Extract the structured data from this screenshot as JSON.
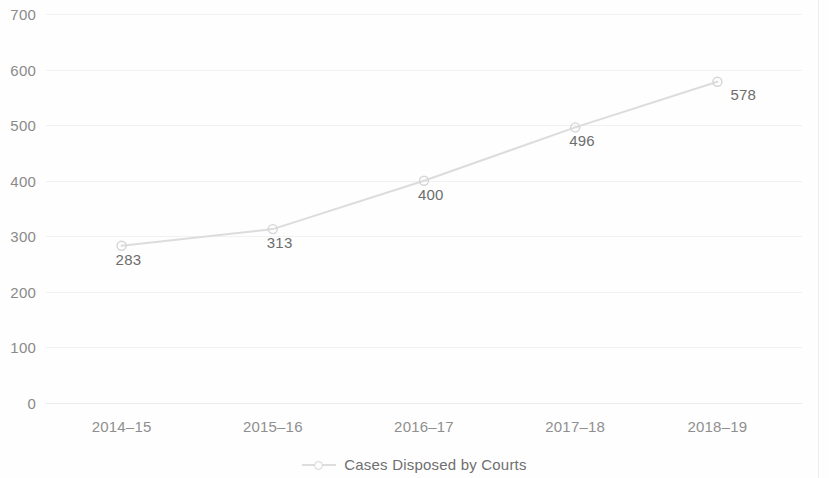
{
  "chart_data": {
    "type": "line",
    "title": "",
    "subtitle": "",
    "xlabel": "",
    "ylabel": "",
    "categories": [
      "2014–15",
      "2015–16",
      "2016–17",
      "2017–18",
      "2018–19"
    ],
    "series": [
      {
        "name": "Cases Disposed by Courts",
        "values": [
          283,
          313,
          400,
          496,
          578
        ]
      }
    ],
    "point_labels": [
      "283",
      "313",
      "400",
      "496",
      "578"
    ],
    "yticks": [
      "0",
      "100",
      "200",
      "300",
      "400",
      "500",
      "600",
      "700"
    ],
    "ytick_values": [
      0,
      100,
      200,
      300,
      400,
      500,
      600,
      700
    ],
    "ylim": [
      0,
      700
    ],
    "grid": "horizontal",
    "legend_position": "bottom-center",
    "colors": {
      "line": "#dcdcdc",
      "marker": "#d6d6d6",
      "gridline": "#f1f1f1",
      "axis_text": "#8a8a8a",
      "label_text": "#6d6d6d",
      "background": "#fefefe"
    }
  },
  "legend": {
    "swatch_icon": "line-marker-icon",
    "label": "Cases Disposed by Courts"
  }
}
